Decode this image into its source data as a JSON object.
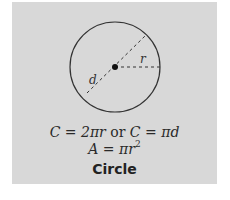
{
  "figure": {
    "title": "Circle",
    "labels": {
      "radius": "r",
      "diameter": "d"
    },
    "formulas": {
      "circumference": {
        "lhs": "C",
        "expr1": "2πr",
        "connector": "or",
        "lhs2": "C",
        "expr2": "πd"
      },
      "area": {
        "lhs": "A",
        "expr_base": "πr",
        "exponent": "2"
      }
    },
    "colors": {
      "background": "#d8d8d8",
      "stroke": "#333333"
    }
  }
}
